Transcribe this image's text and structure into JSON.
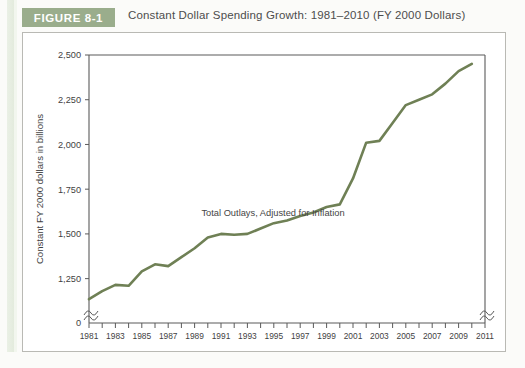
{
  "figure": {
    "badge_label": "FIGURE 8-1",
    "title": "Constant Dollar Spending Growth: 1981–2010 (FY 2000 Dollars)",
    "badge_color": "#9aad8c",
    "frame_color": "#b9b9b4"
  },
  "chart_data": {
    "type": "line",
    "title": "Constant Dollar Spending Growth: 1981–2010 (FY 2000 Dollars)",
    "xlabel": "",
    "ylabel": "Constant FY 2000 dollars in billions",
    "series_annotation": "Total Outlays, Adjusted for Inflation",
    "line_color": "#6f8055",
    "line_width": 2.6,
    "grid": false,
    "legend_position": "inline-annotation",
    "axis_break_y": true,
    "axis_break_x_right": true,
    "xlim": [
      1981,
      2011
    ],
    "ylim": [
      1125,
      2500
    ],
    "y_zero_label": "0",
    "yticks": [
      1250,
      1500,
      1750,
      2000,
      2250,
      2500
    ],
    "ytick_labels": [
      "1,250",
      "1,500",
      "1,750",
      "2,000",
      "2,250",
      "2,500"
    ],
    "xticks": [
      1981,
      1982,
      1983,
      1984,
      1985,
      1986,
      1987,
      1988,
      1989,
      1990,
      1991,
      1992,
      1993,
      1994,
      1995,
      1996,
      1997,
      1998,
      1999,
      2000,
      2001,
      2002,
      2003,
      2004,
      2005,
      2006,
      2007,
      2008,
      2009,
      2010,
      2011
    ],
    "xtick_labels_shown": [
      "1981",
      "1983",
      "1985",
      "1987",
      "1989",
      "1991",
      "1993",
      "1995",
      "1997",
      "1999",
      "2001",
      "2003",
      "2005",
      "2007",
      "2009",
      "2011"
    ],
    "x": [
      1981,
      1982,
      1983,
      1984,
      1985,
      1986,
      1987,
      1988,
      1989,
      1990,
      1991,
      1992,
      1993,
      1994,
      1995,
      1996,
      1997,
      1998,
      1999,
      2000,
      2001,
      2002,
      2003,
      2004,
      2005,
      2006,
      2007,
      2008,
      2009,
      2010
    ],
    "values": [
      1135,
      1180,
      1215,
      1210,
      1290,
      1330,
      1320,
      1370,
      1420,
      1480,
      1500,
      1495,
      1500,
      1530,
      1560,
      1575,
      1600,
      1620,
      1650,
      1665,
      1810,
      2010,
      2020,
      2120,
      2220,
      2250,
      2280,
      2340,
      2410,
      2450
    ]
  }
}
